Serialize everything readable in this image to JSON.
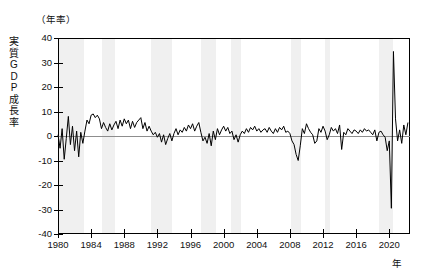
{
  "chart_data": {
    "type": "line",
    "title": "",
    "unit_note": "（年率）",
    "ylabel": "実質GDP成長率",
    "xlabel": "年",
    "ylim": [
      -40,
      40
    ],
    "yticks": [
      40,
      30,
      20,
      10,
      0,
      -10,
      -20,
      -30,
      -40
    ],
    "ytick_labels": [
      "40",
      "30",
      "20",
      "10",
      "0",
      "-10",
      "-20",
      "-30",
      "-40"
    ],
    "xlim": [
      1980.0,
      2022.5
    ],
    "xticks": [
      1980,
      1984,
      1988,
      1992,
      1996,
      2000,
      2004,
      2008,
      2012,
      2016,
      2020
    ],
    "xtick_labels": [
      "1980",
      "1984",
      "1988",
      "1992",
      "1996",
      "2000",
      "2004",
      "2008",
      "2012",
      "2016",
      "2020"
    ],
    "grid": false,
    "legend": "none",
    "line_color": "#000000",
    "zero_line_color": "#8d8d8d",
    "recession_band_color": "#f0f0f0",
    "recession_bands": [
      {
        "start": 1980.1,
        "end": 1983.1
      },
      {
        "start": 1985.3,
        "end": 1986.9
      },
      {
        "start": 1991.2,
        "end": 1993.8
      },
      {
        "start": 1997.3,
        "end": 1999.1
      },
      {
        "start": 2000.9,
        "end": 2002.1
      },
      {
        "start": 2008.1,
        "end": 2009.3
      },
      {
        "start": 2012.2,
        "end": 2012.9
      },
      {
        "start": 2018.8,
        "end": 2020.4
      }
    ],
    "series": [
      {
        "name": "実質GDP成長率（年率）",
        "x": [
          1980.0,
          1980.25,
          1980.5,
          1980.75,
          1981.0,
          1981.25,
          1981.5,
          1981.75,
          1982.0,
          1982.25,
          1982.5,
          1982.75,
          1983.0,
          1983.25,
          1983.5,
          1983.75,
          1984.0,
          1984.25,
          1984.5,
          1984.75,
          1985.0,
          1985.25,
          1985.5,
          1985.75,
          1986.0,
          1986.25,
          1986.5,
          1986.75,
          1987.0,
          1987.25,
          1987.5,
          1987.75,
          1988.0,
          1988.25,
          1988.5,
          1988.75,
          1989.0,
          1989.25,
          1989.5,
          1989.75,
          1990.0,
          1990.25,
          1990.5,
          1990.75,
          1991.0,
          1991.25,
          1991.5,
          1991.75,
          1992.0,
          1992.25,
          1992.5,
          1992.75,
          1993.0,
          1993.25,
          1993.5,
          1993.75,
          1994.0,
          1994.25,
          1994.5,
          1994.75,
          1995.0,
          1995.25,
          1995.5,
          1995.75,
          1996.0,
          1996.25,
          1996.5,
          1996.75,
          1997.0,
          1997.25,
          1997.5,
          1997.75,
          1998.0,
          1998.25,
          1998.5,
          1998.75,
          1999.0,
          1999.25,
          1999.5,
          1999.75,
          2000.0,
          2000.25,
          2000.5,
          2000.75,
          2001.0,
          2001.25,
          2001.5,
          2001.75,
          2002.0,
          2002.25,
          2002.5,
          2002.75,
          2003.0,
          2003.25,
          2003.5,
          2003.75,
          2004.0,
          2004.25,
          2004.5,
          2004.75,
          2005.0,
          2005.25,
          2005.5,
          2005.75,
          2006.0,
          2006.25,
          2006.5,
          2006.75,
          2007.0,
          2007.25,
          2007.5,
          2007.75,
          2008.0,
          2008.25,
          2008.5,
          2008.75,
          2009.0,
          2009.25,
          2009.5,
          2009.75,
          2010.0,
          2010.25,
          2010.5,
          2010.75,
          2011.0,
          2011.25,
          2011.5,
          2011.75,
          2012.0,
          2012.25,
          2012.5,
          2012.75,
          2013.0,
          2013.25,
          2013.5,
          2013.75,
          2014.0,
          2014.25,
          2014.5,
          2014.75,
          2015.0,
          2015.25,
          2015.5,
          2015.75,
          2016.0,
          2016.25,
          2016.5,
          2016.75,
          2017.0,
          2017.25,
          2017.5,
          2017.75,
          2018.0,
          2018.25,
          2018.5,
          2018.75,
          2019.0,
          2019.25,
          2019.5,
          2019.75,
          2020.0,
          2020.25,
          2020.5,
          2020.75,
          2021.0,
          2021.25,
          2021.5,
          2021.75,
          2022.0,
          2022.25
        ],
        "values": [
          0.5,
          -5.0,
          3.0,
          -9.5,
          -1.0,
          8.0,
          -3.5,
          4.0,
          -6.0,
          2.0,
          -8.5,
          1.5,
          -3.0,
          2.0,
          6.5,
          5.0,
          8.5,
          9.0,
          7.5,
          8.5,
          7.0,
          3.0,
          5.5,
          3.5,
          2.0,
          5.0,
          2.5,
          4.5,
          6.0,
          3.0,
          6.5,
          4.0,
          7.0,
          5.0,
          6.5,
          3.0,
          6.0,
          3.5,
          5.5,
          6.5,
          7.5,
          3.0,
          5.5,
          2.0,
          4.0,
          2.0,
          0.5,
          1.5,
          -0.5,
          1.0,
          -2.5,
          0.5,
          -3.5,
          -1.0,
          1.0,
          -2.0,
          1.0,
          3.0,
          0.5,
          2.5,
          1.5,
          3.5,
          2.0,
          4.5,
          3.0,
          5.0,
          2.0,
          4.0,
          5.5,
          1.5,
          -2.0,
          -0.5,
          -3.0,
          1.0,
          -4.0,
          2.0,
          -1.5,
          3.0,
          0.5,
          2.5,
          4.0,
          2.0,
          3.5,
          1.0,
          2.0,
          -1.5,
          0.5,
          -2.5,
          0.5,
          2.0,
          1.0,
          3.0,
          1.5,
          3.5,
          2.5,
          4.0,
          2.0,
          3.0,
          1.5,
          2.5,
          3.0,
          1.5,
          3.5,
          2.0,
          1.0,
          3.0,
          1.5,
          3.5,
          2.5,
          4.0,
          1.5,
          2.0,
          1.0,
          -2.0,
          -3.5,
          -7.5,
          -10.0,
          -4.0,
          3.0,
          1.0,
          5.0,
          3.0,
          1.5,
          0.5,
          -3.0,
          -2.0,
          3.0,
          1.5,
          4.0,
          2.0,
          -1.5,
          0.5,
          3.5,
          2.0,
          3.0,
          1.0,
          4.5,
          -5.5,
          1.5,
          0.5,
          3.0,
          2.0,
          1.0,
          2.5,
          2.0,
          1.0,
          2.5,
          1.5,
          3.0,
          2.0,
          2.5,
          1.5,
          0.5,
          2.5,
          -2.0,
          1.5,
          2.0,
          0.5,
          -0.5,
          -6.0,
          -2.0,
          -29.5,
          34.5,
          7.0,
          -2.0,
          2.5,
          -3.0,
          4.5,
          0.5,
          5.5
        ]
      }
    ]
  }
}
